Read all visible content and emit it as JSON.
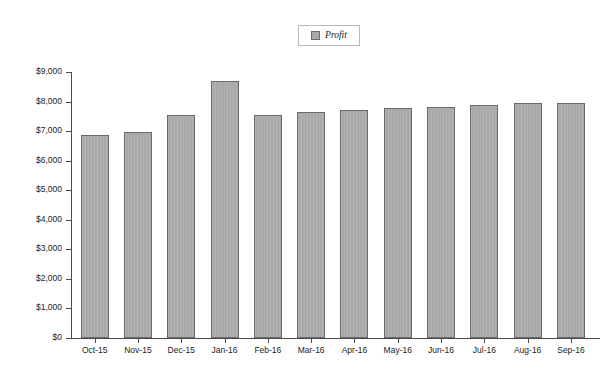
{
  "legend": {
    "label": "Profit",
    "swatch_color": "#a9a9a9",
    "position": "top-center"
  },
  "axis": {
    "y_ticks": [
      "$9,000",
      "$8,000",
      "$7,000",
      "$6,000",
      "$5,000",
      "$4,000",
      "$3,000",
      "$2,000",
      "$1,000",
      "$0"
    ],
    "x_ticks": [
      "Oct-15",
      "Nov-15",
      "Dec-15",
      "Jan-16",
      "Feb-16",
      "Mar-16",
      "Apr-16",
      "May-16",
      "Jun-16",
      "Jul-16",
      "Aug-16",
      "Sep-16"
    ]
  },
  "colors": {
    "bar_fill": "#a9a9a9",
    "bar_border": "#6a6a6a",
    "axis": "#4a4a4a",
    "background": "#ffffff"
  },
  "chart_data": {
    "type": "bar",
    "title": "",
    "xlabel": "",
    "ylabel": "",
    "categories": [
      "Oct-15",
      "Nov-15",
      "Dec-15",
      "Jan-16",
      "Feb-16",
      "Mar-16",
      "Apr-16",
      "May-16",
      "Jun-16",
      "Jul-16",
      "Aug-16",
      "Sep-16"
    ],
    "series": [
      {
        "name": "Profit",
        "values": [
          6870,
          6970,
          7530,
          8680,
          7560,
          7650,
          7700,
          7770,
          7830,
          7900,
          7940,
          7940
        ]
      }
    ],
    "ylim": [
      0,
      9000
    ],
    "ytick_values": [
      9000,
      8000,
      7000,
      6000,
      5000,
      4000,
      3000,
      2000,
      1000,
      0
    ],
    "ytick_labels": [
      "$9,000",
      "$8,000",
      "$7,000",
      "$6,000",
      "$5,000",
      "$4,000",
      "$3,000",
      "$2,000",
      "$1,000",
      "$0"
    ],
    "grid": false,
    "legend_position": "top-center",
    "value_prefix": "$"
  }
}
